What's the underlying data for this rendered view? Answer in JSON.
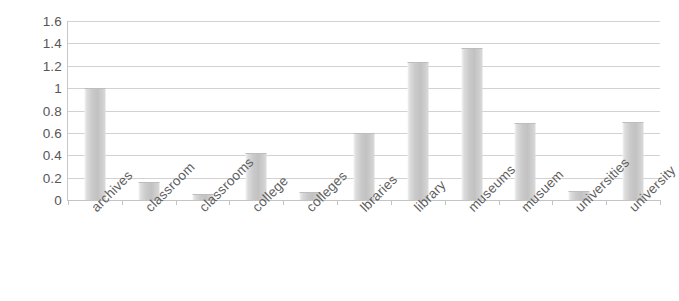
{
  "chart_data": {
    "type": "bar",
    "title": "",
    "subtitle": "",
    "xlabel": "",
    "ylabel": "",
    "categories": [
      "archives",
      "classroom",
      "classrooms",
      "college",
      "colleges",
      "lbraries",
      "library",
      "museums",
      "musuem",
      "universities",
      "university"
    ],
    "values": [
      1.0,
      0.16,
      0.05,
      0.42,
      0.07,
      0.6,
      1.23,
      1.36,
      0.69,
      0.08,
      0.7
    ],
    "ylim": [
      0,
      1.6
    ],
    "ytick_step": 0.2,
    "yticks": [
      "1.6",
      "1.4",
      "1.2",
      "1",
      "0.8",
      "0.6",
      "0.4",
      "0.2",
      "0"
    ],
    "ytick_values": [
      1.6,
      1.4,
      1.2,
      1.0,
      0.8,
      0.6,
      0.4,
      0.2,
      0
    ],
    "grid": true,
    "grid_axis": "y",
    "legend": false,
    "legend_position": "none",
    "series": [
      {
        "name": "",
        "values": [
          1.0,
          0.16,
          0.05,
          0.42,
          0.07,
          0.6,
          1.23,
          1.36,
          0.69,
          0.08,
          0.7
        ]
      }
    ],
    "colors": {
      "bar_fill": "#c5c5c5",
      "bar_highlight": "#f1f1f1",
      "bar_border": "#bdbdbd",
      "gridline": "#d2d2d2",
      "axis": "#c4c4c4",
      "tick_label": "#575757",
      "category_label": "#5e5e5e",
      "background": "#ffffff"
    }
  }
}
